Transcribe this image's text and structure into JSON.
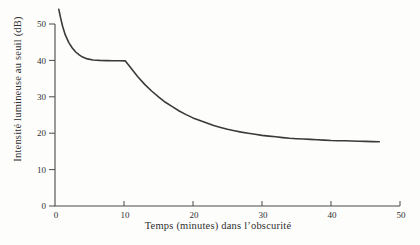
{
  "figure": {
    "background": "#fdfdfc",
    "axis_color": "#4a4a4a",
    "text_color": "#2f2f2f"
  },
  "chart_data": {
    "type": "line",
    "title": "",
    "xlabel": "Temps (minutes) dans l’obscurité",
    "ylabel": "Intensité lumineuse au seuil (dB)",
    "xlim": [
      0,
      50
    ],
    "ylim": [
      0,
      50
    ],
    "x_ticks": [
      0,
      10,
      20,
      30,
      40,
      50
    ],
    "y_ticks": [
      0,
      10,
      20,
      30,
      40,
      50
    ],
    "x_tick_labels": [
      "0",
      "10",
      "20",
      "30",
      "40",
      "50"
    ],
    "y_tick_labels": [
      "0",
      "10",
      "20",
      "30",
      "40",
      "50"
    ],
    "grid": false,
    "legend": null,
    "line_color": "#3a3a3a",
    "series": [
      {
        "name": "seuil-adaptation-obscurite",
        "points": [
          [
            0.55,
            54.0
          ],
          [
            0.8,
            51.8
          ],
          [
            1.1,
            49.4
          ],
          [
            1.5,
            47.0
          ],
          [
            2.0,
            44.9
          ],
          [
            2.5,
            43.4
          ],
          [
            3.0,
            42.3
          ],
          [
            3.5,
            41.5
          ],
          [
            4.0,
            40.9
          ],
          [
            4.7,
            40.4
          ],
          [
            5.5,
            40.1
          ],
          [
            6.5,
            40.0
          ],
          [
            7.5,
            39.95
          ],
          [
            8.5,
            39.9
          ],
          [
            9.4,
            39.9
          ],
          [
            10.2,
            39.85
          ],
          [
            11,
            37.9
          ],
          [
            12,
            35.5
          ],
          [
            13,
            33.4
          ],
          [
            14,
            31.6
          ],
          [
            15,
            30.0
          ],
          [
            16,
            28.5
          ],
          [
            17,
            27.3
          ],
          [
            18,
            26.1
          ],
          [
            19,
            25.1
          ],
          [
            20,
            24.2
          ],
          [
            21,
            23.5
          ],
          [
            22,
            22.8
          ],
          [
            23,
            22.1
          ],
          [
            24,
            21.6
          ],
          [
            25,
            21.1
          ],
          [
            26,
            20.7
          ],
          [
            27,
            20.3
          ],
          [
            28,
            20.0
          ],
          [
            29,
            19.7
          ],
          [
            30,
            19.4
          ],
          [
            31,
            19.2
          ],
          [
            32,
            19.0
          ],
          [
            33,
            18.8
          ],
          [
            34,
            18.6
          ],
          [
            35,
            18.5
          ],
          [
            36,
            18.4
          ],
          [
            37,
            18.3
          ],
          [
            38,
            18.2
          ],
          [
            39,
            18.1
          ],
          [
            40,
            18.0
          ],
          [
            41,
            17.95
          ],
          [
            42,
            17.9
          ],
          [
            43,
            17.85
          ],
          [
            44,
            17.8
          ],
          [
            45,
            17.75
          ],
          [
            46,
            17.7
          ],
          [
            47,
            17.65
          ]
        ]
      }
    ]
  }
}
